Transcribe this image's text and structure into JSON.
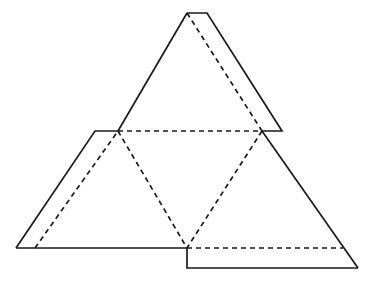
{
  "figure": {
    "background_color": "#ffffff",
    "stroke_color": "#1a1a1a",
    "stroke_width": 1.7,
    "dash_pattern": "5 4",
    "canvas": {
      "width": 377,
      "height": 288
    },
    "points": {
      "apex_left": {
        "x": 187,
        "y": 13
      },
      "apex_right": {
        "x": 207,
        "y": 13
      },
      "mid_left": {
        "x": 118,
        "y": 131
      },
      "mid_right": {
        "x": 262,
        "y": 131
      },
      "shelf_left": {
        "x": 95,
        "y": 131
      },
      "flap_right_top": {
        "x": 282,
        "y": 131
      },
      "bottom_left": {
        "x": 16,
        "y": 248
      },
      "bottom_center": {
        "x": 187,
        "y": 248
      },
      "dash_base_right": {
        "x": 343,
        "y": 248
      },
      "step_corner": {
        "x": 187,
        "y": 268
      },
      "bottom_right": {
        "x": 358,
        "y": 268
      }
    },
    "solid_paths": {
      "top_flap": "M 187 13 L 207 13 L 282 131 L 262 131",
      "upper_left_edge": "M 187 13 L 118 131",
      "left_shelf": "M 118 131 L 95 131 L 16 248",
      "bottom_edge": "M 16 248 L 187 248",
      "step_down": "M 187 248 L 187 268 L 358 268",
      "right_edge": "M 358 268 L 262 131"
    },
    "dashed_paths": {
      "apex_fold": "M 187 13 L 262 131",
      "horizontal_fold": "M 118 131 L 262 131",
      "left_fold": "M 118 131 L 187 248",
      "right_fold": "M 262 131 L 187 248",
      "left_base_fold": "M 35 248 L 118 131",
      "bottom_fold": "M 187 248 L 343 248"
    }
  }
}
